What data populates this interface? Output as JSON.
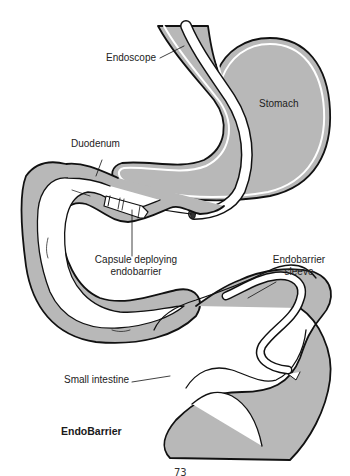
{
  "figure": {
    "title": "EndoBarrier",
    "page_number_partial": "73",
    "colors": {
      "tissue_fill": "#b8b8b8",
      "lumen_fill": "#ffffff",
      "outline": "#111111",
      "background": "#ffffff"
    }
  },
  "labels": {
    "endoscope": "Endoscope",
    "stomach": "Stomach",
    "duodenum": "Duodenum",
    "capsule_line1": "Capsule deploying",
    "capsule_line2": "endobarrier",
    "sleeve_line1": "Endobarrier",
    "sleeve_line2": "sleeve",
    "small_intestine": "Small intestine"
  }
}
